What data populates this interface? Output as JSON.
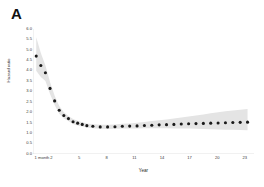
{
  "figure": {
    "panel_letter": "A",
    "background_color": "#ffffff"
  },
  "chart_data": {
    "type": "scatter",
    "title": "",
    "xlabel": "Year",
    "ylabel": "Hazard ratio",
    "xlim": [
      0,
      24
    ],
    "ylim": [
      0.0,
      6.0
    ],
    "grid": false,
    "legend": null,
    "point_color": "#1a1a1a",
    "band_color": "#e2e2e2",
    "band_label": "95% confidence interval",
    "y_ticks": [
      "6.0",
      "5.5",
      "5.0",
      "4.5",
      "4.0",
      "3.5",
      "3.0",
      "2.5",
      "2.0",
      "1.5",
      "1.0",
      "0.5",
      "0.0"
    ],
    "y_tick_values": [
      6.0,
      5.5,
      5.0,
      4.5,
      4.0,
      3.5,
      3.0,
      2.5,
      2.0,
      1.5,
      1.0,
      0.5,
      0.0
    ],
    "x_ticks": [
      "1 month",
      "2",
      "5",
      "8",
      "11",
      "14",
      "17",
      "20",
      "23"
    ],
    "x_tick_values": [
      0.083,
      2,
      5,
      8,
      11,
      14,
      17,
      20,
      23
    ],
    "x": [
      0.35,
      0.85,
      1.35,
      1.85,
      2.35,
      2.85,
      3.35,
      3.85,
      4.35,
      4.85,
      5.35,
      5.85,
      6.5,
      7.3,
      8.1,
      8.9,
      9.7,
      10.5,
      11.3,
      12.1,
      12.9,
      13.7,
      14.5,
      15.3,
      16.1,
      16.9,
      17.7,
      18.5,
      19.3,
      20.1,
      20.9,
      21.7,
      22.5,
      23.3
    ],
    "values": [
      4.7,
      4.25,
      3.9,
      3.15,
      2.55,
      2.1,
      1.85,
      1.7,
      1.55,
      1.48,
      1.42,
      1.36,
      1.33,
      1.3,
      1.3,
      1.31,
      1.33,
      1.34,
      1.35,
      1.37,
      1.38,
      1.4,
      1.41,
      1.42,
      1.44,
      1.45,
      1.46,
      1.47,
      1.48,
      1.49,
      1.5,
      1.51,
      1.52,
      1.53
    ],
    "band_upper": [
      5.6,
      4.85,
      4.25,
      3.45,
      2.8,
      2.3,
      2.0,
      1.83,
      1.68,
      1.6,
      1.53,
      1.47,
      1.43,
      1.4,
      1.4,
      1.42,
      1.45,
      1.47,
      1.5,
      1.54,
      1.58,
      1.62,
      1.66,
      1.7,
      1.75,
      1.8,
      1.85,
      1.9,
      1.96,
      2.0,
      2.05,
      2.09,
      2.13,
      2.16
    ],
    "band_lower": [
      4.0,
      3.7,
      3.5,
      2.88,
      2.35,
      1.93,
      1.7,
      1.58,
      1.44,
      1.37,
      1.32,
      1.27,
      1.24,
      1.21,
      1.2,
      1.21,
      1.22,
      1.23,
      1.23,
      1.24,
      1.24,
      1.24,
      1.24,
      1.23,
      1.23,
      1.22,
      1.21,
      1.2,
      1.19,
      1.18,
      1.17,
      1.16,
      1.15,
      1.14
    ]
  }
}
